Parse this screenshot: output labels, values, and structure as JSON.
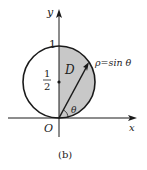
{
  "figure": {
    "caption": "(b)",
    "axes": {
      "x_label": "x",
      "y_label": "y",
      "origin_label": "O"
    },
    "tick_labels": {
      "y_top": "1",
      "half_num": "1",
      "half_den": "2"
    },
    "region_label": "D",
    "curve_label": "ρ=sin θ",
    "angle_label": "θ",
    "colors": {
      "shade": "#c8c8c8",
      "stroke": "#1a1a1a"
    }
  }
}
